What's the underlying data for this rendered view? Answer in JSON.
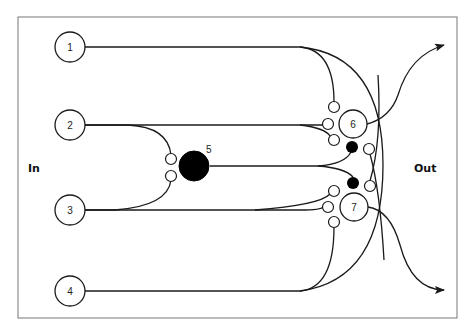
{
  "diagram": {
    "labels": {
      "input_side": "In",
      "output_side": "Out"
    },
    "input_nodes": [
      {
        "id": "1",
        "label": "1"
      },
      {
        "id": "2",
        "label": "2"
      },
      {
        "id": "3",
        "label": "3"
      },
      {
        "id": "4",
        "label": "4"
      }
    ],
    "hidden_node": {
      "id": "5",
      "label": "5"
    },
    "output_nodes": [
      {
        "id": "6",
        "label": "6"
      },
      {
        "id": "7",
        "label": "7"
      }
    ],
    "colors": {
      "stroke": "#1a1a1a",
      "frame": "#777777",
      "inhibitory_fill": "#000000",
      "excitatory_fill": "#ffffff"
    }
  }
}
